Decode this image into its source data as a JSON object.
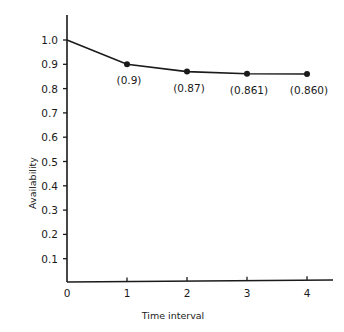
{
  "chart_data": {
    "type": "line",
    "title": "",
    "xlabel": "Time interval",
    "ylabel": "Availability",
    "x": [
      0,
      1,
      2,
      3,
      4
    ],
    "values": [
      1.0,
      0.9,
      0.87,
      0.861,
      0.86
    ],
    "data_labels": [
      "",
      "(0.9)",
      "(0.87)",
      "(0.861)",
      "(0.860)"
    ],
    "markers": [
      false,
      true,
      true,
      true,
      true
    ],
    "x_ticks": [
      "0",
      "1",
      "2",
      "3",
      "4"
    ],
    "y_ticks": [
      "0.1",
      "0.2",
      "0.3",
      "0.4",
      "0.5",
      "0.6",
      "0.7",
      "0.8",
      "0.9",
      "1.0"
    ],
    "xlim": [
      0,
      4.4
    ],
    "ylim": [
      0,
      1.1
    ],
    "grid": false,
    "legend": null,
    "colors": {
      "line": "#1a1a1a",
      "background": "#ffffff"
    }
  }
}
